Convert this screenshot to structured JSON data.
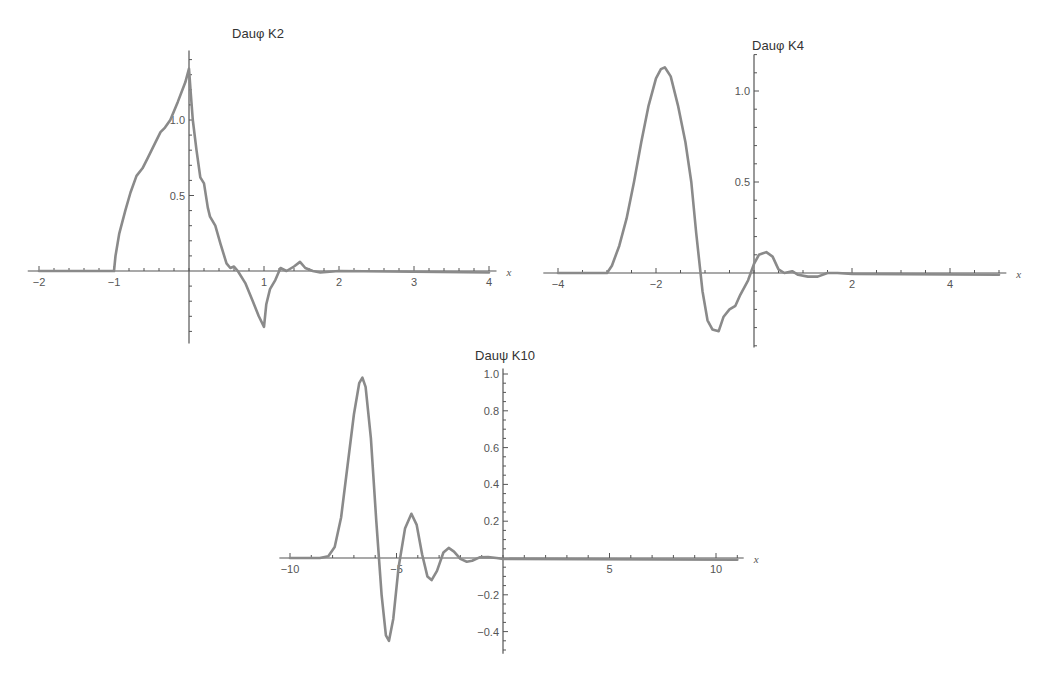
{
  "chart_data": [
    {
      "id": "k2",
      "type": "line",
      "title": "Dauφ K2",
      "xlabel": "x",
      "ylabel": "",
      "xlim": [
        -2.1,
        4.15
      ],
      "ylim": [
        -0.48,
        1.45
      ],
      "xticks_major": [
        -2,
        -1,
        1,
        2,
        3,
        4
      ],
      "xtick_labels": [
        "-2",
        "-1",
        "1",
        "2",
        "3",
        "4"
      ],
      "yticks_major": [
        0.5,
        1.0
      ],
      "ytick_labels": [
        "0.5",
        "1.0"
      ],
      "grid": false,
      "legend": null,
      "series": [
        {
          "name": "Daubechies scaling function (2 coeff. set)",
          "points": [
            [
              -2.0,
              0
            ],
            [
              -1.0,
              0
            ],
            [
              -0.98,
              0.1
            ],
            [
              -0.93,
              0.25
            ],
            [
              -0.85,
              0.4
            ],
            [
              -0.78,
              0.52
            ],
            [
              -0.7,
              0.63
            ],
            [
              -0.62,
              0.68
            ],
            [
              -0.55,
              0.75
            ],
            [
              -0.45,
              0.85
            ],
            [
              -0.38,
              0.92
            ],
            [
              -0.32,
              0.95
            ],
            [
              -0.25,
              1.0
            ],
            [
              -0.15,
              1.12
            ],
            [
              -0.05,
              1.25
            ],
            [
              0.0,
              1.34
            ],
            [
              0.02,
              1.2
            ],
            [
              0.05,
              1.0
            ],
            [
              0.1,
              0.8
            ],
            [
              0.15,
              0.62
            ],
            [
              0.2,
              0.58
            ],
            [
              0.25,
              0.42
            ],
            [
              0.28,
              0.36
            ],
            [
              0.35,
              0.3
            ],
            [
              0.42,
              0.18
            ],
            [
              0.5,
              0.05
            ],
            [
              0.55,
              0.02
            ],
            [
              0.6,
              0.03
            ],
            [
              0.65,
              0.0
            ],
            [
              0.75,
              -0.08
            ],
            [
              0.85,
              -0.2
            ],
            [
              0.93,
              -0.3
            ],
            [
              1.0,
              -0.37
            ],
            [
              1.03,
              -0.22
            ],
            [
              1.08,
              -0.12
            ],
            [
              1.15,
              -0.06
            ],
            [
              1.22,
              0.02
            ],
            [
              1.3,
              0.0
            ],
            [
              1.4,
              0.03
            ],
            [
              1.48,
              0.06
            ],
            [
              1.55,
              0.02
            ],
            [
              1.65,
              0.0
            ],
            [
              1.75,
              -0.01
            ],
            [
              2.0,
              0.0
            ],
            [
              4.0,
              -0.01
            ]
          ]
        }
      ],
      "layout": {
        "x0px": 189,
        "x_px_per_unit": 75,
        "y0px": 271,
        "y_px_per_unit": 151,
        "axis_x_from": -2.15,
        "axis_x_to": 4.1,
        "axis_y_from": -0.48,
        "axis_y_to": 1.46,
        "title_x": 258,
        "title_y": 38,
        "minor_x": 0.2,
        "minor_y": 0.1
      }
    },
    {
      "id": "k4",
      "type": "line",
      "title": "Dauφ K4",
      "xlabel": "x",
      "ylabel": "",
      "xlim": [
        -4.2,
        5.1
      ],
      "ylim": [
        -0.4,
        1.2
      ],
      "xticks_major": [
        -4,
        -2,
        2,
        4
      ],
      "xtick_labels": [
        "-4",
        "-2",
        "2",
        "4"
      ],
      "yticks_major": [
        0.5,
        1.0
      ],
      "ytick_labels": [
        "0.5",
        "1.0"
      ],
      "grid": false,
      "legend": null,
      "series": [
        {
          "name": "Daubechies scaling function (4 coeff. set)",
          "points": [
            [
              -4.0,
              0
            ],
            [
              -3.0,
              0
            ],
            [
              -2.9,
              0.04
            ],
            [
              -2.75,
              0.15
            ],
            [
              -2.6,
              0.3
            ],
            [
              -2.45,
              0.5
            ],
            [
              -2.3,
              0.72
            ],
            [
              -2.15,
              0.92
            ],
            [
              -2.0,
              1.07
            ],
            [
              -1.9,
              1.12
            ],
            [
              -1.82,
              1.13
            ],
            [
              -1.7,
              1.08
            ],
            [
              -1.55,
              0.92
            ],
            [
              -1.4,
              0.72
            ],
            [
              -1.28,
              0.5
            ],
            [
              -1.18,
              0.22
            ],
            [
              -1.05,
              -0.1
            ],
            [
              -0.95,
              -0.26
            ],
            [
              -0.85,
              -0.31
            ],
            [
              -0.72,
              -0.32
            ],
            [
              -0.62,
              -0.24
            ],
            [
              -0.5,
              -0.2
            ],
            [
              -0.38,
              -0.18
            ],
            [
              -0.28,
              -0.12
            ],
            [
              -0.12,
              -0.04
            ],
            [
              0.0,
              0.05
            ],
            [
              0.1,
              0.1
            ],
            [
              0.25,
              0.115
            ],
            [
              0.38,
              0.09
            ],
            [
              0.5,
              0.02
            ],
            [
              0.62,
              0.0
            ],
            [
              0.78,
              0.01
            ],
            [
              0.9,
              -0.01
            ],
            [
              1.1,
              -0.02
            ],
            [
              1.3,
              -0.02
            ],
            [
              1.5,
              0.0
            ],
            [
              1.7,
              0.0
            ],
            [
              2.0,
              -0.005
            ],
            [
              5.0,
              -0.01
            ]
          ]
        }
      ],
      "layout": {
        "x0px": 754,
        "x_px_per_unit": 49,
        "y0px": 273,
        "y_px_per_unit": 182,
        "axis_x_from": -4.3,
        "axis_x_to": 5.15,
        "axis_y_from": -0.41,
        "axis_y_to": 1.2,
        "title_x": 778,
        "title_y": 50,
        "minor_x": 0.5,
        "minor_y": 0.1
      }
    },
    {
      "id": "k10",
      "type": "line",
      "title": "Dauψ K10",
      "xlabel": "x",
      "ylabel": "",
      "xlim": [
        -10.5,
        11.2
      ],
      "ylim": [
        -0.52,
        1.05
      ],
      "xticks_major": [
        -10,
        -5,
        5,
        10
      ],
      "xtick_labels": [
        "-10",
        "-5",
        "5",
        "10"
      ],
      "yticks_major": [
        -0.4,
        -0.2,
        0.2,
        0.4,
        0.6,
        0.8,
        1.0
      ],
      "ytick_labels": [
        "-0.4",
        "-0.2",
        "0.2",
        "0.4",
        "0.6",
        "0.8",
        "1.0"
      ],
      "grid": false,
      "legend": null,
      "series": [
        {
          "name": "Daubechies wavelet function (10 coeff. set)",
          "points": [
            [
              -10.0,
              0
            ],
            [
              -8.6,
              0
            ],
            [
              -8.2,
              0.01
            ],
            [
              -7.9,
              0.06
            ],
            [
              -7.6,
              0.22
            ],
            [
              -7.3,
              0.5
            ],
            [
              -7.0,
              0.78
            ],
            [
              -6.75,
              0.95
            ],
            [
              -6.6,
              0.98
            ],
            [
              -6.45,
              0.93
            ],
            [
              -6.2,
              0.65
            ],
            [
              -5.95,
              0.2
            ],
            [
              -5.7,
              -0.2
            ],
            [
              -5.5,
              -0.42
            ],
            [
              -5.35,
              -0.45
            ],
            [
              -5.15,
              -0.33
            ],
            [
              -4.9,
              -0.05
            ],
            [
              -4.6,
              0.16
            ],
            [
              -4.3,
              0.24
            ],
            [
              -4.05,
              0.18
            ],
            [
              -3.8,
              0.02
            ],
            [
              -3.55,
              -0.1
            ],
            [
              -3.35,
              -0.12
            ],
            [
              -3.1,
              -0.07
            ],
            [
              -2.8,
              0.03
            ],
            [
              -2.55,
              0.055
            ],
            [
              -2.3,
              0.035
            ],
            [
              -2.0,
              -0.005
            ],
            [
              -1.7,
              -0.02
            ],
            [
              -1.45,
              -0.015
            ],
            [
              -1.1,
              0.003
            ],
            [
              -0.7,
              0.005
            ],
            [
              -0.3,
              0.0
            ],
            [
              0.0,
              -0.005
            ],
            [
              11.0,
              -0.01
            ]
          ]
        }
      ],
      "layout": {
        "x0px": 503,
        "x_px_per_unit": 21.3,
        "y0px": 558,
        "y_px_per_unit": 184,
        "axis_x_from": -10.5,
        "axis_x_to": 11.3,
        "axis_y_from": -0.52,
        "axis_y_to": 1.03,
        "title_x": 505,
        "title_y": 360,
        "minor_x": 1,
        "minor_y": 0.05
      }
    }
  ]
}
